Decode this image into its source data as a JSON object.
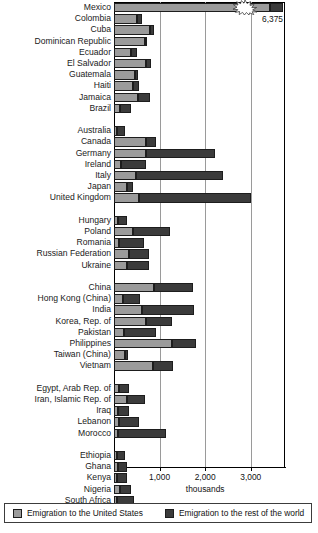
{
  "chart_data": {
    "type": "bar",
    "orientation": "horizontal",
    "stacked": true,
    "title": "",
    "xlabel": "thousands",
    "ylabel": "",
    "xlim": [
      0,
      3800
    ],
    "xticks": [
      1000,
      2000,
      3000
    ],
    "xtick_labels": [
      "1,000",
      "2,000",
      "3,000"
    ],
    "grid": "vertical-at-xticks",
    "legend_position": "bottom",
    "series": [
      {
        "name": "Emigration to the United States",
        "color": "#9b9b9b"
      },
      {
        "name": "Emigration to the rest of the world",
        "color": "#3b3b3b"
      }
    ],
    "annotations": [
      {
        "text": "6,375",
        "for": "Mexico",
        "note": "axis-break value label for clipped bar"
      }
    ],
    "groups": [
      {
        "name": "Latin America and the Caribbean",
        "rows": [
          {
            "label": "Mexico",
            "us": 3700,
            "world": 120,
            "total_label": "6,375",
            "clipped": true
          },
          {
            "label": "Colombia",
            "us": 500,
            "world": 120
          },
          {
            "label": "Cuba",
            "us": 800,
            "world": 80
          },
          {
            "label": "Dominican Republic",
            "us": 690,
            "world": 30
          },
          {
            "label": "Ecuador",
            "us": 380,
            "world": 120
          },
          {
            "label": "El Salvador",
            "us": 700,
            "world": 110
          },
          {
            "label": "Guatemala",
            "us": 470,
            "world": 60
          },
          {
            "label": "Haiti",
            "us": 420,
            "world": 130
          },
          {
            "label": "Jamaica",
            "us": 520,
            "world": 280
          },
          {
            "label": "Brazil",
            "us": 130,
            "world": 250
          }
        ]
      },
      {
        "name": "High-income OECD",
        "rows": [
          {
            "label": "Australia",
            "us": 70,
            "world": 180
          },
          {
            "label": "Canada",
            "us": 700,
            "world": 230
          },
          {
            "label": "Germany",
            "us": 700,
            "world": 1520
          },
          {
            "label": "Ireland",
            "us": 150,
            "world": 560
          },
          {
            "label": "Italy",
            "us": 480,
            "world": 1900
          },
          {
            "label": "Japan",
            "us": 280,
            "world": 130
          },
          {
            "label": "United Kingdom",
            "us": 540,
            "world": 2460
          }
        ]
      },
      {
        "name": "Europe and Central Asia",
        "rows": [
          {
            "label": "Hungary",
            "us": 80,
            "world": 210
          },
          {
            "label": "Poland",
            "us": 420,
            "world": 810
          },
          {
            "label": "Romania",
            "us": 120,
            "world": 540
          },
          {
            "label": "Russian Federation",
            "us": 320,
            "world": 440
          },
          {
            "label": "Ukraine",
            "us": 280,
            "world": 480
          }
        ]
      },
      {
        "name": "East and South Asia",
        "rows": [
          {
            "label": "China",
            "us": 870,
            "world": 870
          },
          {
            "label": "Hong Kong (China)",
            "us": 200,
            "world": 370
          },
          {
            "label": "India",
            "us": 620,
            "world": 1130
          },
          {
            "label": "Korea, Rep. of",
            "us": 700,
            "world": 570
          },
          {
            "label": "Pakistan",
            "us": 220,
            "world": 700
          },
          {
            "label": "Philippines",
            "us": 1270,
            "world": 520
          },
          {
            "label": "Taiwan (China)",
            "us": 250,
            "world": 60
          },
          {
            "label": "Vietnam",
            "us": 860,
            "world": 440
          }
        ]
      },
      {
        "name": "Middle East and North Africa",
        "rows": [
          {
            "label": "Egypt, Arab Rep. of",
            "us": 120,
            "world": 200
          },
          {
            "label": "Iran, Islamic Rep. of",
            "us": 280,
            "world": 400
          },
          {
            "label": "Iraq",
            "us": 80,
            "world": 250
          },
          {
            "label": "Lebanon",
            "us": 110,
            "world": 440
          },
          {
            "label": "Morocco",
            "us": 80,
            "world": 1060
          }
        ]
      },
      {
        "name": "Sub-Saharan Africa",
        "rows": [
          {
            "label": "Ethiopia",
            "us": 70,
            "world": 170
          },
          {
            "label": "Ghana",
            "us": 90,
            "world": 190
          },
          {
            "label": "Kenya",
            "us": 70,
            "world": 220
          },
          {
            "label": "Nigeria",
            "us": 140,
            "world": 240
          },
          {
            "label": "South Africa",
            "us": 70,
            "world": 370
          }
        ]
      }
    ]
  },
  "axis": {
    "unit_label": "thousands",
    "break_value_label": "6,375"
  },
  "legend": {
    "items": [
      {
        "label": "Emigration to the United States",
        "swatch": "us"
      },
      {
        "label": "Emigration to the rest of the world",
        "swatch": "world"
      }
    ]
  }
}
